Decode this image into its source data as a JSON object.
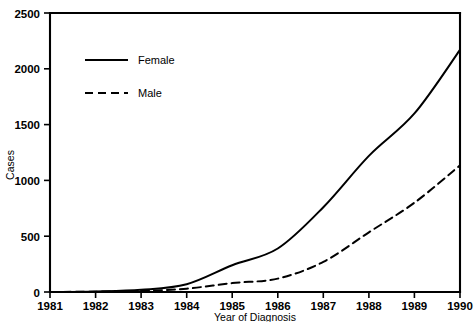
{
  "chart_data": {
    "type": "line",
    "title": "",
    "xlabel": "Year of Diagnosis",
    "ylabel": "Cases",
    "x": [
      1981,
      1982,
      1983,
      1984,
      1985,
      1986,
      1987,
      1988,
      1989,
      1990
    ],
    "xticklabels": [
      "1981",
      "1982",
      "1983",
      "1984",
      "1985",
      "1986",
      "1987",
      "1988",
      "1989",
      "1990"
    ],
    "yticklabels": [
      "0",
      "500",
      "1000",
      "1500",
      "2000",
      "2500"
    ],
    "yticks": [
      0,
      500,
      1000,
      1500,
      2000,
      2500
    ],
    "xlim": [
      1981,
      1990
    ],
    "ylim": [
      0,
      2500
    ],
    "grid": false,
    "legend_position": "upper-left-inside",
    "series": [
      {
        "name": "Female",
        "style": "solid",
        "color": "#000000",
        "values": [
          0,
          5,
          20,
          70,
          240,
          390,
          760,
          1220,
          1600,
          2170
        ]
      },
      {
        "name": "Male",
        "style": "dashed",
        "color": "#000000",
        "values": [
          0,
          3,
          10,
          30,
          80,
          120,
          270,
          535,
          800,
          1135
        ]
      }
    ]
  },
  "legend": {
    "entries": [
      {
        "label": "Female",
        "style": "solid"
      },
      {
        "label": "Male",
        "style": "dashed"
      }
    ]
  },
  "axes": {
    "y_title": "Cases",
    "x_title": "Year of Diagnosis"
  },
  "colors": {
    "background": "#ffffff",
    "foreground": "#000000"
  }
}
